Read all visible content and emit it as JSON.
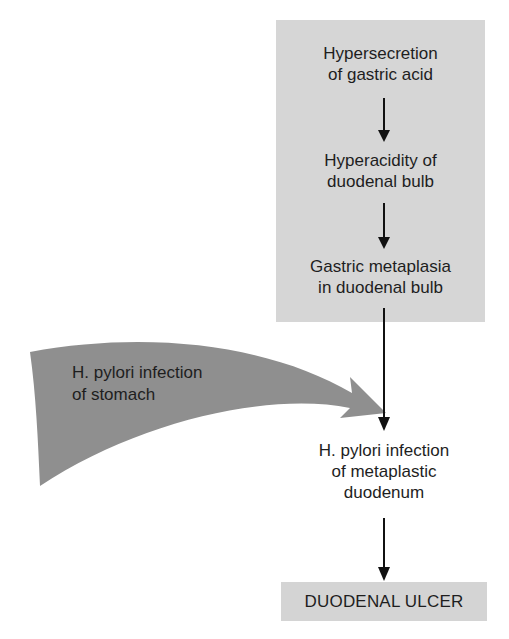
{
  "diagram": {
    "type": "flowchart",
    "nodes": {
      "hypersecretion": "Hypersecretion\nof gastric acid",
      "hyperacidity": "Hyperacidity of\nduodenal bulb",
      "metaplasia": "Gastric metaplasia\nin duodenal bulb",
      "stomach_infection": "H. pylori infection\nof stomach",
      "duodenum_infection": "H. pylori infection\nof metaplastic\nduodenum",
      "outcome": "DUODENAL ULCER"
    },
    "edges": [
      {
        "from": "hypersecretion",
        "to": "hyperacidity"
      },
      {
        "from": "hyperacidity",
        "to": "metaplasia"
      },
      {
        "from": "metaplasia",
        "to": "duodenum_infection"
      },
      {
        "from": "stomach_infection",
        "to": "duodenum_infection",
        "style": "curved-block-arrow"
      },
      {
        "from": "duodenum_infection",
        "to": "outcome"
      }
    ],
    "colors": {
      "cause_box": "#d6d6d6",
      "outcome_box": "#d4d4d4",
      "curved_arrow": "#8f8f8f",
      "line": "#111111",
      "text": "#1e1e1e"
    }
  }
}
